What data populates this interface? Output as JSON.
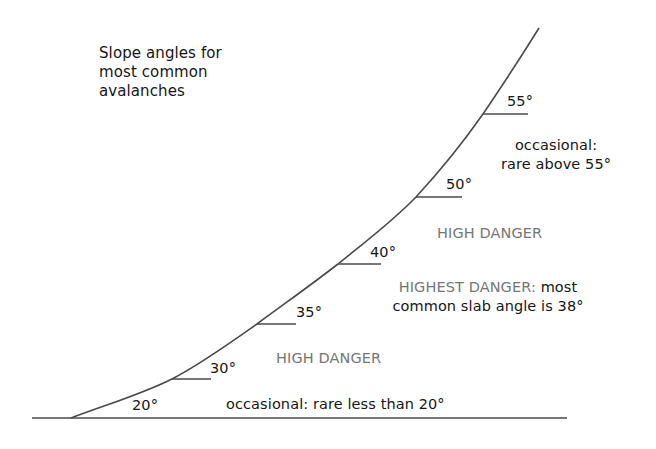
{
  "diagram": {
    "title_lines": [
      "Slope angles for",
      "most common",
      "avalanches"
    ],
    "angle_labels": {
      "a20": "20°",
      "a30": "30°",
      "a35": "35°",
      "a40": "40°",
      "a50": "50°",
      "a55": "55°"
    },
    "zones": {
      "top_occasional_line1": "occasional:",
      "top_occasional_line2": "rare above 55°",
      "upper_high_danger": "HIGH DANGER",
      "highest_danger_prefix": "HIGHEST DANGER:",
      "highest_danger_suffix": " most",
      "highest_danger_line2": "common slab angle is 38°",
      "lower_high_danger": "HIGH DANGER",
      "bottom_occasional": "occasional: rare less than 20°"
    },
    "colors": {
      "line": "#4a4a4a",
      "text": "#161616",
      "danger_text": "#767676",
      "background": "#ffffff"
    },
    "geometry": {
      "baseline": {
        "x1": 32,
        "x2": 567,
        "y": 418
      },
      "curve_points": [
        [
          71,
          418
        ],
        [
          172,
          379
        ],
        [
          257,
          324
        ],
        [
          338,
          264
        ],
        [
          416,
          197
        ],
        [
          483,
          114
        ],
        [
          539,
          28
        ]
      ],
      "ticks": [
        {
          "angle": 30,
          "x1": 172,
          "x2": 211,
          "y": 379
        },
        {
          "angle": 35,
          "x1": 257,
          "x2": 296,
          "y": 324
        },
        {
          "angle": 40,
          "x1": 338,
          "x2": 381,
          "y": 264
        },
        {
          "angle": 50,
          "x1": 416,
          "x2": 462,
          "y": 197
        },
        {
          "angle": 55,
          "x1": 483,
          "x2": 528,
          "y": 114
        }
      ]
    }
  }
}
